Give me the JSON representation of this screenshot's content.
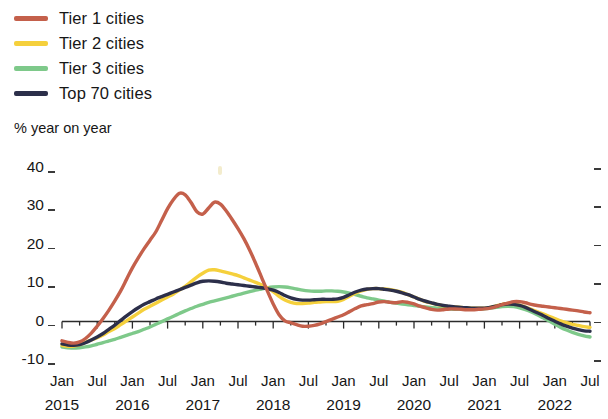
{
  "legend": {
    "position": "top-left",
    "items": [
      {
        "label": "Tier 1 cities",
        "color": "#c4604b"
      },
      {
        "label": "Tier 2 cities",
        "color": "#f5d03c"
      },
      {
        "label": "Tier 3 cities",
        "color": "#7ec98a"
      },
      {
        "label": "Top 70 cities",
        "color": "#2c2f4a"
      }
    ]
  },
  "chart_data": {
    "type": "line",
    "title": "",
    "subtitle": "",
    "ylabel": "% year on year",
    "xlabel": "",
    "ylim": [
      -10,
      40
    ],
    "yticks": [
      40,
      30,
      20,
      10,
      0,
      -10
    ],
    "ytick_labels": [
      "40",
      "30",
      "20",
      "10",
      "0",
      "-10"
    ],
    "grid": false,
    "zero_line": 0,
    "x_start": "Jan 2015",
    "x_end": "Jul 2022",
    "x_tick_months": [
      "Jan",
      "Jul",
      "Jan",
      "Jul",
      "Jan",
      "Jul",
      "Jan",
      "Jul",
      "Jan",
      "Jul",
      "Jan",
      "Jul",
      "Jan",
      "Jul",
      "Jan",
      "Jul"
    ],
    "x_tick_years": [
      "2015",
      "2016",
      "2017",
      "2018",
      "2019",
      "2020",
      "2021",
      "2022"
    ],
    "x_minor_interval_months": 3,
    "x": [
      "2015-01",
      "2015-02",
      "2015-03",
      "2015-04",
      "2015-05",
      "2015-06",
      "2015-07",
      "2015-08",
      "2015-09",
      "2015-10",
      "2015-11",
      "2015-12",
      "2016-01",
      "2016-02",
      "2016-03",
      "2016-04",
      "2016-05",
      "2016-06",
      "2016-07",
      "2016-08",
      "2016-09",
      "2016-10",
      "2016-11",
      "2016-12",
      "2017-01",
      "2017-02",
      "2017-03",
      "2017-04",
      "2017-05",
      "2017-06",
      "2017-07",
      "2017-08",
      "2017-09",
      "2017-10",
      "2017-11",
      "2017-12",
      "2018-01",
      "2018-02",
      "2018-03",
      "2018-04",
      "2018-05",
      "2018-06",
      "2018-07",
      "2018-08",
      "2018-09",
      "2018-10",
      "2018-11",
      "2018-12",
      "2019-01",
      "2019-02",
      "2019-03",
      "2019-04",
      "2019-05",
      "2019-06",
      "2019-07",
      "2019-08",
      "2019-09",
      "2019-10",
      "2019-11",
      "2019-12",
      "2020-01",
      "2020-02",
      "2020-03",
      "2020-04",
      "2020-05",
      "2020-06",
      "2020-07",
      "2020-08",
      "2020-09",
      "2020-10",
      "2020-11",
      "2020-12",
      "2021-01",
      "2021-02",
      "2021-03",
      "2021-04",
      "2021-05",
      "2021-06",
      "2021-07",
      "2021-08",
      "2021-09",
      "2021-10",
      "2021-11",
      "2021-12",
      "2022-01",
      "2022-02",
      "2022-03",
      "2022-04",
      "2022-05",
      "2022-06",
      "2022-07"
    ],
    "series": [
      {
        "name": "Tier 1 cities",
        "color": "#c4604b",
        "values": [
          -5.0,
          -5.4,
          -5.6,
          -5.3,
          -4.4,
          -3.0,
          -1.2,
          0.8,
          3.0,
          5.4,
          8.0,
          11.0,
          14.0,
          16.6,
          19.0,
          21.2,
          23.4,
          26.4,
          29.4,
          31.8,
          33.4,
          33.0,
          31.0,
          28.6,
          28.0,
          29.6,
          31.1,
          30.6,
          28.8,
          26.6,
          24.2,
          21.6,
          18.6,
          15.2,
          11.6,
          8.0,
          4.6,
          1.8,
          0.2,
          -0.3,
          -0.8,
          -1.2,
          -1.2,
          -1.0,
          -0.6,
          0.0,
          0.6,
          1.2,
          1.8,
          2.6,
          3.4,
          4.1,
          4.4,
          4.7,
          5.1,
          5.2,
          5.0,
          4.9,
          5.2,
          5.0,
          4.6,
          4.0,
          3.6,
          3.2,
          3.0,
          3.1,
          3.3,
          3.3,
          3.2,
          3.1,
          3.1,
          3.2,
          3.3,
          3.5,
          3.9,
          4.4,
          4.8,
          5.2,
          5.2,
          4.9,
          4.5,
          4.2,
          4.0,
          3.8,
          3.6,
          3.4,
          3.2,
          3.0,
          2.8,
          2.5,
          2.3
        ]
      },
      {
        "name": "Tier 2 cities",
        "color": "#f5d03c",
        "values": [
          -6.2,
          -6.4,
          -6.4,
          -6.0,
          -5.4,
          -4.8,
          -4.2,
          -3.5,
          -2.6,
          -1.8,
          -0.8,
          0.2,
          1.2,
          2.2,
          3.2,
          4.0,
          4.8,
          5.6,
          6.4,
          7.2,
          8.2,
          9.2,
          10.4,
          11.6,
          12.6,
          13.4,
          13.5,
          13.2,
          12.8,
          12.4,
          12.0,
          11.4,
          10.8,
          10.2,
          9.6,
          8.8,
          7.8,
          6.6,
          5.6,
          5.0,
          4.7,
          4.7,
          4.8,
          5.0,
          5.1,
          5.2,
          5.2,
          5.3,
          5.8,
          6.6,
          7.4,
          8.0,
          8.4,
          8.6,
          8.6,
          8.5,
          8.3,
          8.0,
          7.6,
          7.0,
          6.4,
          5.8,
          5.2,
          4.8,
          4.4,
          4.1,
          3.9,
          3.8,
          3.7,
          3.6,
          3.5,
          3.5,
          3.5,
          3.7,
          4.1,
          4.5,
          4.7,
          4.6,
          4.3,
          3.8,
          3.2,
          2.6,
          2.0,
          1.4,
          0.8,
          0.2,
          -0.3,
          -0.7,
          -1.0,
          -1.3,
          -1.5
        ]
      },
      {
        "name": "Tier 3 cities",
        "color": "#7ec98a",
        "values": [
          -6.6,
          -6.8,
          -6.9,
          -6.8,
          -6.6,
          -6.3,
          -5.9,
          -5.5,
          -5.0,
          -4.6,
          -4.1,
          -3.6,
          -3.1,
          -2.6,
          -2.0,
          -1.4,
          -0.7,
          0.0,
          0.7,
          1.4,
          2.1,
          2.8,
          3.4,
          4.0,
          4.5,
          5.0,
          5.4,
          5.8,
          6.2,
          6.6,
          7.0,
          7.4,
          7.8,
          8.2,
          8.5,
          8.8,
          9.0,
          9.1,
          9.0,
          8.8,
          8.5,
          8.2,
          8.0,
          7.9,
          7.9,
          8.0,
          8.0,
          7.9,
          7.7,
          7.4,
          7.0,
          6.6,
          6.2,
          5.9,
          5.6,
          5.3,
          5.0,
          4.8,
          4.6,
          4.4,
          4.2,
          4.0,
          3.8,
          3.6,
          3.5,
          3.4,
          3.3,
          3.2,
          3.2,
          3.2,
          3.2,
          3.2,
          3.3,
          3.5,
          3.7,
          3.9,
          4.0,
          3.9,
          3.6,
          3.1,
          2.5,
          1.8,
          1.0,
          0.2,
          -0.7,
          -1.5,
          -2.2,
          -2.8,
          -3.3,
          -3.7,
          -4.0
        ]
      },
      {
        "name": "Top 70 cities",
        "color": "#2c2f4a",
        "values": [
          -5.8,
          -6.1,
          -6.2,
          -6.0,
          -5.5,
          -4.8,
          -4.0,
          -3.1,
          -2.0,
          -0.9,
          0.3,
          1.5,
          2.6,
          3.6,
          4.5,
          5.2,
          5.9,
          6.5,
          7.1,
          7.7,
          8.3,
          8.9,
          9.5,
          10.1,
          10.5,
          10.6,
          10.5,
          10.3,
          10.0,
          9.8,
          9.6,
          9.4,
          9.2,
          9.0,
          8.8,
          8.6,
          8.2,
          7.6,
          6.8,
          6.2,
          5.8,
          5.6,
          5.6,
          5.7,
          5.8,
          5.8,
          5.8,
          5.9,
          6.3,
          7.0,
          7.7,
          8.2,
          8.5,
          8.6,
          8.6,
          8.4,
          8.2,
          7.9,
          7.5,
          7.0,
          6.4,
          5.8,
          5.3,
          4.9,
          4.5,
          4.2,
          4.0,
          3.8,
          3.7,
          3.6,
          3.5,
          3.5,
          3.5,
          3.7,
          4.0,
          4.4,
          4.6,
          4.5,
          4.2,
          3.7,
          3.0,
          2.3,
          1.6,
          0.8,
          0.1,
          -0.6,
          -1.2,
          -1.7,
          -2.1,
          -2.4,
          -2.5
        ]
      }
    ]
  },
  "plot_geometry": {
    "left": 62,
    "right": 590,
    "top": 168,
    "bottom": 360
  }
}
